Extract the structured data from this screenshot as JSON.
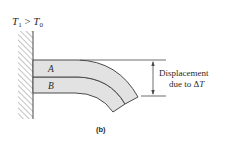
{
  "condition_label": {
    "T": "T",
    "sub1": "1",
    "relation": " > ",
    "T2": "T",
    "sub0": "0"
  },
  "layers": {
    "top": "A",
    "bottom": "B"
  },
  "dimension": {
    "line1": "Displacement",
    "line2_prefix": "due to ",
    "delta": "Δ",
    "T": "T"
  },
  "caption": "(b)",
  "colors": {
    "beam_fill": "#e2e2e2",
    "stroke": "#4a4a4a",
    "hatch": "#8a8a8a",
    "text": "#2a2a2a"
  }
}
